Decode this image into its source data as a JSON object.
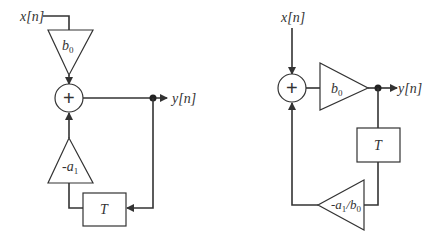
{
  "diagrams": [
    {
      "name": "direct-form",
      "input_label": "x[n]",
      "output_label": "y[n]",
      "feedforward_gain": {
        "base": "b",
        "sub": "0"
      },
      "feedback_gain": {
        "base": "-a",
        "sub": "1"
      },
      "delay_label": "T",
      "adder_symbol": "+"
    },
    {
      "name": "transposed-form",
      "input_label": "x[n]",
      "output_label": "y[n]",
      "feedforward_gain": {
        "base": "b",
        "sub": "0"
      },
      "feedback_gain": {
        "base1": "-a",
        "sub1": "1",
        "sep": "/b",
        "sub2": "0"
      },
      "delay_label": "T",
      "adder_symbol": "+"
    }
  ]
}
